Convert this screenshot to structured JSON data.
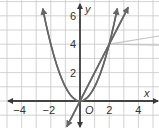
{
  "chart_data": {
    "type": "line",
    "title": "",
    "xlabel": "x",
    "ylabel": "y",
    "origin_label": "O",
    "xlim": [
      -5.5,
      5
    ],
    "ylim": [
      -1.9,
      7
    ],
    "grid": true,
    "x_ticks": [
      {
        "value": -4,
        "label": "−4"
      },
      {
        "value": -2,
        "label": "−2"
      },
      {
        "value": 2,
        "label": "2"
      },
      {
        "value": 4,
        "label": "4"
      }
    ],
    "y_ticks": [
      {
        "value": 2,
        "label": "2"
      },
      {
        "value": 4,
        "label": "4"
      },
      {
        "value": 6,
        "label": "6"
      }
    ],
    "series": [
      {
        "name": "parabola",
        "equation": "y = x^2",
        "x_range": [
          -2.55,
          2.55
        ]
      },
      {
        "name": "line",
        "equation": "y = 2x",
        "x_range": [
          -0.9,
          3.3
        ]
      }
    ],
    "intersections": [
      [
        0,
        0
      ],
      [
        2,
        4
      ]
    ],
    "callout_from": [
      2,
      4
    ]
  }
}
